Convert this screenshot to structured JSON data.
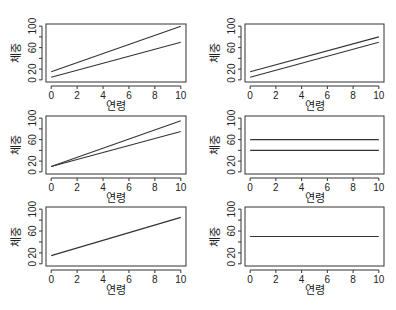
{
  "figure": {
    "xlabel": "연령",
    "ylabel": "체중",
    "line_color": "#333333",
    "box_color": "#333333"
  },
  "chart_data": [
    {
      "type": "line",
      "panel": 1,
      "xlabel": "연령",
      "ylabel": "체중",
      "xlim": [
        0,
        10
      ],
      "ylim": [
        0,
        100
      ],
      "xticks": [
        0,
        2,
        4,
        6,
        8,
        10
      ],
      "yticks": [
        0,
        20,
        60,
        100
      ],
      "series": [
        {
          "name": "line1",
          "x": [
            0,
            10
          ],
          "y": [
            15,
            100
          ]
        },
        {
          "name": "line2",
          "x": [
            0,
            10
          ],
          "y": [
            5,
            70
          ]
        }
      ]
    },
    {
      "type": "line",
      "panel": 2,
      "xlabel": "연령",
      "ylabel": "체중",
      "xlim": [
        0,
        10
      ],
      "ylim": [
        0,
        100
      ],
      "xticks": [
        0,
        2,
        4,
        6,
        8,
        10
      ],
      "yticks": [
        0,
        20,
        60,
        100
      ],
      "series": [
        {
          "name": "line1",
          "x": [
            0,
            10
          ],
          "y": [
            15,
            80
          ]
        },
        {
          "name": "line2",
          "x": [
            0,
            10
          ],
          "y": [
            5,
            70
          ]
        }
      ]
    },
    {
      "type": "line",
      "panel": 3,
      "xlabel": "연령",
      "ylabel": "체중",
      "xlim": [
        0,
        10
      ],
      "ylim": [
        0,
        100
      ],
      "xticks": [
        0,
        2,
        4,
        6,
        8,
        10
      ],
      "yticks": [
        0,
        20,
        60,
        100
      ],
      "series": [
        {
          "name": "line1",
          "x": [
            0,
            10
          ],
          "y": [
            10,
            95
          ]
        },
        {
          "name": "line2",
          "x": [
            0,
            10
          ],
          "y": [
            10,
            75
          ]
        }
      ]
    },
    {
      "type": "line",
      "panel": 4,
      "xlabel": "연령",
      "ylabel": "체중",
      "xlim": [
        0,
        10
      ],
      "ylim": [
        0,
        100
      ],
      "xticks": [
        0,
        2,
        4,
        6,
        8,
        10
      ],
      "yticks": [
        0,
        20,
        60,
        100
      ],
      "series": [
        {
          "name": "line1",
          "x": [
            0,
            10
          ],
          "y": [
            60,
            60
          ]
        },
        {
          "name": "line2",
          "x": [
            0,
            10
          ],
          "y": [
            40,
            40
          ]
        }
      ]
    },
    {
      "type": "line",
      "panel": 5,
      "xlabel": "연령",
      "ylabel": "체중",
      "xlim": [
        0,
        10
      ],
      "ylim": [
        0,
        100
      ],
      "xticks": [
        0,
        2,
        4,
        6,
        8,
        10
      ],
      "yticks": [
        0,
        20,
        60,
        100
      ],
      "series": [
        {
          "name": "line1",
          "x": [
            0,
            10
          ],
          "y": [
            15,
            85
          ]
        }
      ]
    },
    {
      "type": "line",
      "panel": 6,
      "xlabel": "연령",
      "ylabel": "체중",
      "xlim": [
        0,
        10
      ],
      "ylim": [
        0,
        100
      ],
      "xticks": [
        0,
        2,
        4,
        6,
        8,
        10
      ],
      "yticks": [
        0,
        20,
        60,
        100
      ],
      "series": [
        {
          "name": "line1",
          "x": [
            0,
            10
          ],
          "y": [
            50,
            50
          ]
        }
      ]
    }
  ]
}
